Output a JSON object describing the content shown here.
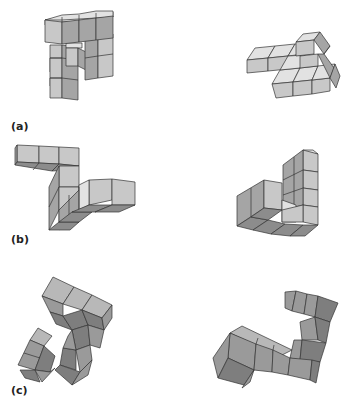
{
  "figure": {
    "panels": [
      {
        "id": "a",
        "label": "(a)",
        "description": "pair of cube-assembly objects"
      },
      {
        "id": "b",
        "label": "(b)",
        "description": "pair of cube-assembly objects"
      },
      {
        "id": "c",
        "label": "(c)",
        "description": "pair of cube-assembly objects"
      }
    ]
  },
  "colors": {
    "top_face": "#e2e2e2",
    "front_face": "#c8c8c8",
    "side_face": "#a5a5a5",
    "dark_face": "#8c8c8c",
    "edge": "#333333",
    "background": "#ffffff"
  }
}
